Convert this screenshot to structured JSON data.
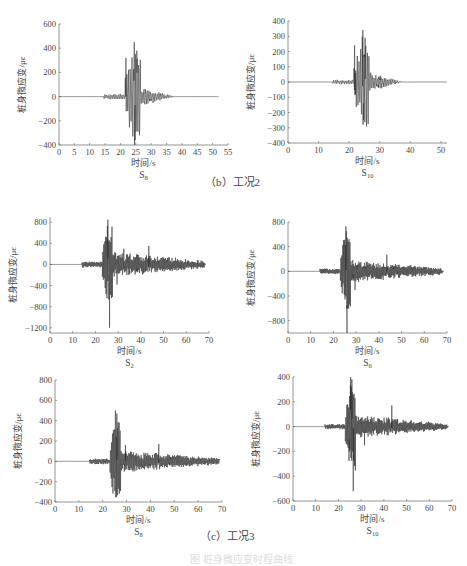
{
  "figure": {
    "captions": [
      {
        "id": "b",
        "text": "（b）工况2",
        "x": 205,
        "y": 173
      },
      {
        "id": "c",
        "text": "（c）工况3",
        "x": 200,
        "y": 528
      }
    ],
    "faint_bottom_caption": "图 桩身微应变时程曲线"
  },
  "colors": {
    "axis": "#7a7a7a",
    "line": "#2a2a2a",
    "text": "#444444"
  },
  "chart_data": [
    {
      "id": "b-S8",
      "group": "（b）工况2",
      "type": "line",
      "title": "S8",
      "title_main": "S",
      "title_sub": "8",
      "xlabel": "时间/s",
      "ylabel": "桩身微应变/με",
      "xlim": [
        0,
        55
      ],
      "ylim": [
        -400,
        600
      ],
      "xticks": [
        0,
        5,
        10,
        15,
        20,
        25,
        30,
        35,
        40,
        45,
        50,
        55
      ],
      "yticks": [
        -400,
        -200,
        0,
        200,
        400,
        600
      ],
      "frame": {
        "x0": 59,
        "x1": 228,
        "yTop": 24,
        "yBot": 145
      },
      "signal": {
        "t_end": 52,
        "onset": 14.5,
        "main_start": 21.5,
        "peak_t": 24.5,
        "decay_end": 37,
        "pre_amp": 15,
        "max_pos": 450,
        "max_neg": -360,
        "tail_amp": 70,
        "late_amp": 4,
        "period": 0.55,
        "seed": 3
      },
      "peaks": [
        {
          "t": 21.8,
          "v": 320
        },
        {
          "t": 24.5,
          "v": 450
        },
        {
          "t": 24.8,
          "v": -360
        },
        {
          "t": 25.3,
          "v": 380
        },
        {
          "t": 22.3,
          "v": -120
        }
      ]
    },
    {
      "id": "b-S10",
      "group": "（b）工况2",
      "type": "line",
      "title": "S10",
      "title_main": "S",
      "title_sub": "10",
      "xlabel": "时间/s",
      "ylabel": "桩身微应变/με",
      "xlim": [
        0,
        52
      ],
      "ylim": [
        -400,
        400
      ],
      "xticks": [
        0,
        10,
        20,
        30,
        40,
        50
      ],
      "yticks": [
        -400,
        -300,
        -200,
        -100,
        0,
        100,
        200,
        300,
        400
      ],
      "frame": {
        "x0": 288,
        "x1": 447,
        "yTop": 21,
        "yBot": 143
      },
      "signal": {
        "t_end": 52,
        "onset": 14.5,
        "main_start": 21.5,
        "peak_t": 24.5,
        "decay_end": 37,
        "pre_amp": 10,
        "max_pos": 340,
        "max_neg": -250,
        "tail_amp": 55,
        "late_amp": 3,
        "period": 0.55,
        "seed": 7
      },
      "peaks": [
        {
          "t": 21.8,
          "v": 240
        },
        {
          "t": 24.5,
          "v": 340
        },
        {
          "t": 24.7,
          "v": -250
        },
        {
          "t": 25.2,
          "v": 290
        },
        {
          "t": 22.1,
          "v": -80
        }
      ]
    },
    {
      "id": "c-S2",
      "group": "（c）工况3",
      "type": "line",
      "title": "S2",
      "title_main": "S",
      "title_sub": "2",
      "xlabel": "时间/s",
      "ylabel": "桩身微应变/με",
      "xlim": [
        0,
        70
      ],
      "ylim": [
        -1300,
        900
      ],
      "xticks": [
        0,
        10,
        20,
        30,
        40,
        50,
        60,
        70
      ],
      "yticks": [
        -1200,
        -800,
        -400,
        0,
        400,
        800
      ],
      "frame": {
        "x0": 50,
        "x1": 209,
        "yTop": 217,
        "yBot": 333
      },
      "signal": {
        "t_end": 68.5,
        "onset": 14,
        "main_start": 23,
        "peak_t": 25.5,
        "decay_end": 68,
        "pre_amp": 40,
        "max_pos": 850,
        "max_neg": -1200,
        "tail_amp": 200,
        "late_amp": 60,
        "period": 0.4,
        "seed": 11
      },
      "peaks": [
        {
          "t": 25.5,
          "v": 850
        },
        {
          "t": 26.2,
          "v": -1200
        },
        {
          "t": 25.0,
          "v": -420
        },
        {
          "t": 43.5,
          "v": 350
        },
        {
          "t": 29.5,
          "v": -380
        },
        {
          "t": 32.5,
          "v": 300
        }
      ]
    },
    {
      "id": "c-S6",
      "group": "（c）工况3",
      "type": "line",
      "title": "S6",
      "title_main": "S",
      "title_sub": "6",
      "xlabel": "时间/s",
      "ylabel": "桩身微应变/με",
      "xlim": [
        0,
        70
      ],
      "ylim": [
        -1000,
        800
      ],
      "xticks": [
        0,
        10,
        20,
        30,
        40,
        50,
        60,
        70
      ],
      "yticks": [
        -800,
        -400,
        0,
        400,
        800
      ],
      "frame": {
        "x0": 288,
        "x1": 447,
        "yTop": 222,
        "yBot": 333
      },
      "signal": {
        "t_end": 68.5,
        "onset": 14,
        "main_start": 23,
        "peak_t": 25.5,
        "decay_end": 68,
        "pre_amp": 30,
        "max_pos": 730,
        "max_neg": -1000,
        "tail_amp": 150,
        "late_amp": 45,
        "period": 0.4,
        "seed": 13
      },
      "peaks": [
        {
          "t": 25.5,
          "v": 730
        },
        {
          "t": 26.0,
          "v": -1000
        },
        {
          "t": 24.8,
          "v": -380
        },
        {
          "t": 43.5,
          "v": 270
        },
        {
          "t": 29.5,
          "v": -300
        }
      ]
    },
    {
      "id": "c-S8",
      "group": "（c）工况3",
      "type": "line",
      "title": "S8",
      "title_main": "S",
      "title_sub": "8",
      "xlabel": "时间/s",
      "ylabel": "桩身微应变/με",
      "xlim": [
        0,
        70
      ],
      "ylim": [
        -400,
        800
      ],
      "xticks": [
        0,
        10,
        20,
        30,
        40,
        50,
        60,
        70
      ],
      "yticks": [
        -400,
        -200,
        0,
        200,
        400,
        600,
        800
      ],
      "frame": {
        "x0": 55,
        "x1": 222,
        "yTop": 380,
        "yBot": 502
      },
      "signal": {
        "t_end": 69,
        "onset": 14.5,
        "main_start": 23,
        "peak_t": 25.5,
        "decay_end": 69,
        "pre_amp": 20,
        "max_pos": 500,
        "max_neg": -330,
        "tail_amp": 90,
        "late_amp": 25,
        "period": 0.4,
        "seed": 17
      },
      "peaks": [
        {
          "t": 25.3,
          "v": 500
        },
        {
          "t": 25.9,
          "v": 470
        },
        {
          "t": 26.3,
          "v": -330
        },
        {
          "t": 24.7,
          "v": -150
        },
        {
          "t": 43.5,
          "v": 170
        },
        {
          "t": 29.5,
          "v": 160
        }
      ]
    },
    {
      "id": "c-S10",
      "group": "（c）工况3",
      "type": "line",
      "title": "S10",
      "title_main": "S",
      "title_sub": "10",
      "xlabel": "时间/s",
      "ylabel": "桩身微应变/με",
      "xlim": [
        0,
        70
      ],
      "ylim": [
        -600,
        400
      ],
      "xticks": [
        0,
        10,
        20,
        30,
        40,
        50,
        60,
        70
      ],
      "yticks": [
        -600,
        -400,
        -200,
        0,
        200,
        400
      ],
      "frame": {
        "x0": 293,
        "x1": 452,
        "yTop": 377,
        "yBot": 501
      },
      "signal": {
        "t_end": 68.5,
        "onset": 14,
        "main_start": 23,
        "peak_t": 25.5,
        "decay_end": 68,
        "pre_amp": 15,
        "max_pos": 400,
        "max_neg": -520,
        "tail_amp": 80,
        "late_amp": 20,
        "period": 0.4,
        "seed": 19
      },
      "peaks": [
        {
          "t": 25.4,
          "v": 400
        },
        {
          "t": 25.9,
          "v": 380
        },
        {
          "t": 26.5,
          "v": -520
        },
        {
          "t": 24.8,
          "v": -200
        },
        {
          "t": 43.5,
          "v": 170
        },
        {
          "t": 31.5,
          "v": -150
        }
      ]
    }
  ]
}
